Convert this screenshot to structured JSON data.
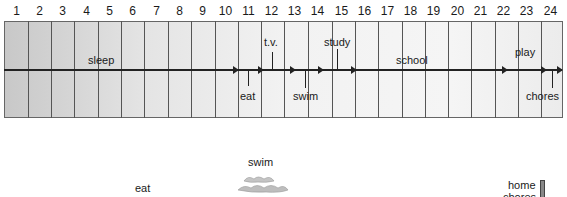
{
  "hours": [
    "1",
    "2",
    "3",
    "4",
    "5",
    "6",
    "7",
    "8",
    "9",
    "10",
    "11",
    "12",
    "13",
    "14",
    "15",
    "16",
    "17",
    "18",
    "19",
    "20",
    "21",
    "22",
    "23",
    "24"
  ],
  "activities_above": [
    {
      "label": "sleep",
      "hour_start": 1,
      "hour_end": 10
    },
    {
      "label": "t.v.",
      "hour_start": 12,
      "hour_end": 12
    },
    {
      "label": "study",
      "hour_start": 14,
      "hour_end": 15
    },
    {
      "label": "school",
      "hour_start": 16,
      "hour_end": 22
    },
    {
      "label": "play",
      "hour_start": 22,
      "hour_end": 23
    }
  ],
  "activities_below": [
    {
      "label": "eat",
      "hour_start": 11,
      "hour_end": 11
    },
    {
      "label": "swim",
      "hour_start": 13,
      "hour_end": 13
    },
    {
      "label": "chores",
      "hour_start": 24,
      "hour_end": 24
    }
  ],
  "legend": {
    "eat": "eat",
    "swim": "swim",
    "home_chores_line1": "home",
    "home_chores_line2": "chores"
  },
  "colors": {
    "line": "#222222",
    "grid": "#555555",
    "fill_dark": "#c8c8c8",
    "fill_light": "#f5f5f5"
  }
}
